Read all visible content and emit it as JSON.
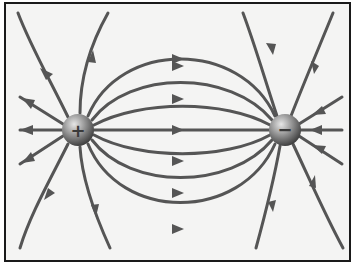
{
  "diagram": {
    "title": "",
    "colors": {
      "background": "#f4f4f3",
      "frame": "#1a1a1a",
      "field_line": "#555555",
      "charge_light": "#cfcfcf",
      "charge_dark": "#4a4a4a"
    },
    "charges": [
      {
        "id": "positive",
        "sign": "+",
        "x": 78,
        "y": 130,
        "radius": 16
      },
      {
        "id": "negative",
        "sign": "−",
        "x": 285,
        "y": 130,
        "radius": 16
      }
    ],
    "field_line_direction": "from positive charge to negative charge",
    "connecting_lines": 7,
    "outward_lines_positive": 6,
    "inward_lines_negative": 6
  }
}
